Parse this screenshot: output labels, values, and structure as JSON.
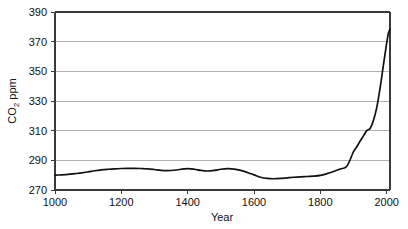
{
  "chart_data": {
    "type": "line",
    "title": "",
    "xlabel": "Year",
    "ylabel": "CO2 ppm",
    "ylabel_main": "CO",
    "ylabel_sub": "2",
    "ylabel_tail": " ppm",
    "xlim": [
      1000,
      2010
    ],
    "ylim": [
      270,
      390
    ],
    "grid": true,
    "legend": "none",
    "line_color": "#111111",
    "grid_color": "#b2b2b2",
    "frame_color": "#3a3a3a",
    "background_color": "#ffffff",
    "xticks": [
      1000,
      1200,
      1400,
      1600,
      1800,
      2000
    ],
    "xtick_labels": [
      "1000",
      "1200",
      "1400",
      "1600",
      "1800",
      "2000"
    ],
    "yticks": [
      270,
      290,
      310,
      330,
      350,
      370,
      390
    ],
    "ytick_labels": [
      "270",
      "290",
      "310",
      "330",
      "350",
      "370",
      "390"
    ],
    "series": [
      {
        "name": "Atmospheric CO2 concentration",
        "x": [
          1000,
          1020,
          1040,
          1060,
          1080,
          1100,
          1120,
          1140,
          1160,
          1180,
          1200,
          1220,
          1240,
          1260,
          1280,
          1300,
          1320,
          1340,
          1360,
          1380,
          1400,
          1420,
          1440,
          1460,
          1480,
          1500,
          1520,
          1540,
          1560,
          1580,
          1600,
          1620,
          1640,
          1660,
          1680,
          1700,
          1720,
          1740,
          1760,
          1780,
          1800,
          1820,
          1840,
          1860,
          1880,
          1900,
          1910,
          1920,
          1930,
          1940,
          1950,
          1960,
          1970,
          1980,
          1990,
          2000,
          2005,
          2010
        ],
        "values": [
          280.0,
          280.2,
          280.5,
          281.0,
          281.5,
          282.2,
          283.0,
          283.6,
          284.0,
          284.3,
          284.5,
          284.6,
          284.6,
          284.5,
          284.3,
          283.8,
          283.2,
          283.0,
          283.3,
          284.0,
          284.4,
          284.0,
          283.2,
          282.8,
          283.2,
          284.0,
          284.4,
          284.1,
          283.2,
          281.8,
          280.2,
          278.6,
          277.8,
          277.6,
          277.8,
          278.2,
          278.6,
          278.9,
          279.1,
          279.3,
          279.8,
          281.0,
          282.5,
          284.2,
          286.0,
          295.8,
          299.2,
          303.0,
          306.5,
          310.0,
          311.5,
          316.8,
          325.5,
          338.5,
          354.0,
          369.0,
          375.5,
          378.5
        ]
      }
    ]
  },
  "annotations": {
    "description": "Atmospheric carbon dioxide concentration from year 1000 to 2010"
  }
}
